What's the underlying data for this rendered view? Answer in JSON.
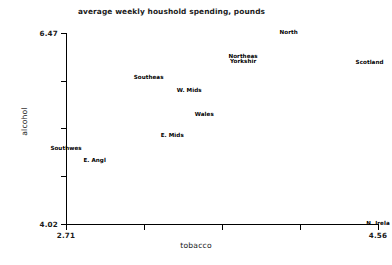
{
  "chart_data": {
    "type": "scatter",
    "title": "average weekly houshold spending, pounds",
    "xlabel": "tobacco",
    "ylabel": "alcohol",
    "xlim": [
      2.71,
      4.56
    ],
    "ylim": [
      4.02,
      6.47
    ],
    "grid": false,
    "legend": null,
    "marker_style": "text-label-only",
    "xticks": [
      "2.71",
      "",
      "",
      "",
      "4.56"
    ],
    "xtick_values": [
      2.71,
      3.1725,
      3.635,
      4.0975,
      4.56
    ],
    "yticks": [
      "4.02",
      "",
      "",
      "",
      "6.47"
    ],
    "ytick_values": [
      4.02,
      4.6325,
      5.245,
      5.8575,
      6.47
    ],
    "points": [
      {
        "label": "North",
        "lines": [
          "North"
        ],
        "x": 4.03,
        "y": 6.47
      },
      {
        "label": "Yorkshire & Northeast",
        "lines": [
          "Northeas",
          "Yorkshir"
        ],
        "x": 3.76,
        "y": 6.13
      },
      {
        "label": "Scotland",
        "lines": [
          "Scotland"
        ],
        "x": 4.51,
        "y": 6.08
      },
      {
        "label": "Southeast",
        "lines": [
          "Southeas"
        ],
        "x": 3.2,
        "y": 5.89
      },
      {
        "label": "W. Mids",
        "lines": [
          "W. Mids"
        ],
        "x": 3.44,
        "y": 5.73
      },
      {
        "label": "Wales",
        "lines": [
          "Wales"
        ],
        "x": 3.53,
        "y": 5.42
      },
      {
        "label": "E. Mids",
        "lines": [
          "E. Mids"
        ],
        "x": 3.34,
        "y": 5.15
      },
      {
        "label": "Southwest",
        "lines": [
          "Southwes"
        ],
        "x": 2.71,
        "y": 4.98
      },
      {
        "label": "E. Anglia",
        "lines": [
          "E. Angl"
        ],
        "x": 2.88,
        "y": 4.83
      },
      {
        "label": "N. Ireland",
        "lines": [
          "N. Irela"
        ],
        "x": 4.56,
        "y": 4.02
      }
    ]
  }
}
